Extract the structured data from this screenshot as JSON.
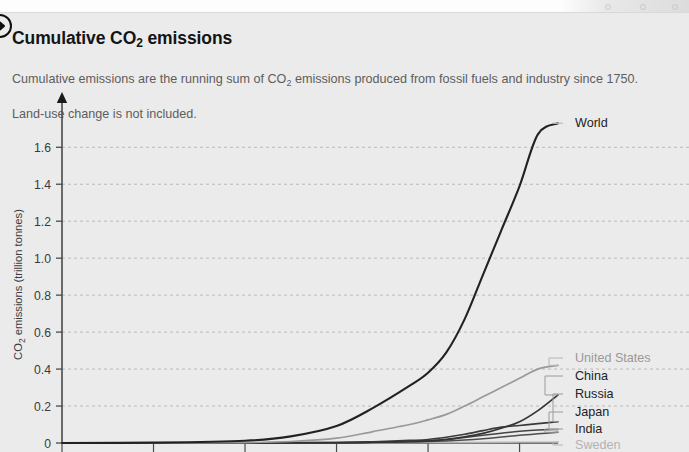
{
  "header": {
    "badge_icon": "circled-arrow-right-icon",
    "title_main": "Cumulative CO",
    "title_sub": "2",
    "title_tail": " emissions",
    "subtitle_part1": "Cumulative emissions are the running sum of CO",
    "subtitle_sub": "2",
    "subtitle_part2": " emissions produced from fossil fuels and industry since 1750.",
    "subtitle_line2": "Land-use change is not included."
  },
  "chart_data": {
    "type": "line",
    "title": "Cumulative CO2 emissions",
    "subtitle": "Cumulative emissions are the running sum of CO2 emissions produced from fossil fuels and industry since 1750. Land-use change is not included.",
    "xlabel": "",
    "ylabel": "CO2 emissions (trillion tonnes)",
    "ylabel_display": "CO",
    "ylabel_sub": "2",
    "ylabel_tail": " emissions (trillion tonnes)",
    "ylim": [
      0,
      1.78
    ],
    "xlim": [
      1750,
      2021
    ],
    "grid": true,
    "grid_style": "dashed-horizontal",
    "legend_position": "right-inline-labels",
    "yticks": [
      0,
      0.2,
      0.4,
      0.6,
      0.8,
      1.0,
      1.2,
      1.4,
      1.6
    ],
    "ytick_labels": [
      "0",
      "0.2",
      "0.4",
      "0.6",
      "0.8",
      "1.0",
      "1.2",
      "1.4",
      "1.6"
    ],
    "xticks": [
      1750,
      1800,
      1850,
      1900,
      1950,
      2000
    ],
    "xtick_labels": [],
    "series": [
      {
        "name": "World",
        "color": "#222222",
        "width": 2.1,
        "final_value": 1.73,
        "x": [
          1750,
          1800,
          1850,
          1875,
          1900,
          1920,
          1940,
          1950,
          1960,
          1970,
          1980,
          1990,
          2000,
          2010,
          2021
        ],
        "values": [
          0,
          0.002,
          0.012,
          0.036,
          0.092,
          0.19,
          0.31,
          0.38,
          0.49,
          0.67,
          0.91,
          1.15,
          1.39,
          1.67,
          1.73
        ]
      },
      {
        "name": "United States",
        "color": "#999999",
        "width": 1.7,
        "final_value": 0.42,
        "x": [
          1750,
          1800,
          1850,
          1875,
          1900,
          1920,
          1940,
          1950,
          1960,
          1970,
          1980,
          1990,
          2000,
          2010,
          2021
        ],
        "values": [
          0,
          0.0003,
          0.002,
          0.008,
          0.026,
          0.062,
          0.1,
          0.125,
          0.155,
          0.2,
          0.25,
          0.3,
          0.35,
          0.4,
          0.42
        ]
      },
      {
        "name": "China",
        "color": "#333333",
        "width": 1.7,
        "final_value": 0.26,
        "x": [
          1750,
          1850,
          1900,
          1920,
          1940,
          1950,
          1960,
          1970,
          1980,
          1990,
          2000,
          2010,
          2021
        ],
        "values": [
          0,
          0.0005,
          0.002,
          0.004,
          0.008,
          0.011,
          0.02,
          0.033,
          0.052,
          0.08,
          0.115,
          0.175,
          0.26
        ]
      },
      {
        "name": "Russia",
        "color": "#3a3a3a",
        "width": 1.6,
        "final_value": 0.115,
        "x": [
          1750,
          1850,
          1900,
          1920,
          1940,
          1950,
          1960,
          1970,
          1980,
          1990,
          2000,
          2010,
          2021
        ],
        "values": [
          0,
          0.0004,
          0.003,
          0.007,
          0.014,
          0.019,
          0.031,
          0.047,
          0.067,
          0.086,
          0.095,
          0.105,
          0.115
        ]
      },
      {
        "name": "Japan",
        "color": "#444444",
        "width": 1.5,
        "final_value": 0.073,
        "x": [
          1750,
          1850,
          1900,
          1920,
          1940,
          1950,
          1960,
          1970,
          1980,
          1990,
          2000,
          2010,
          2021
        ],
        "values": [
          0,
          0.0001,
          0.001,
          0.004,
          0.01,
          0.013,
          0.018,
          0.03,
          0.042,
          0.053,
          0.063,
          0.07,
          0.073
        ]
      },
      {
        "name": "India",
        "color": "#4d4d4d",
        "width": 1.5,
        "final_value": 0.058,
        "x": [
          1750,
          1850,
          1900,
          1920,
          1940,
          1950,
          1960,
          1970,
          1980,
          1990,
          2000,
          2010,
          2021
        ],
        "values": [
          0,
          0.0001,
          0.001,
          0.003,
          0.006,
          0.008,
          0.011,
          0.016,
          0.023,
          0.032,
          0.042,
          0.05,
          0.058
        ]
      },
      {
        "name": "Sweden",
        "color": "#b3b3b3",
        "width": 1.4,
        "final_value": 0.005,
        "x": [
          1750,
          1850,
          1900,
          1950,
          2000,
          2021
        ],
        "values": [
          0,
          0.0,
          0.0005,
          0.002,
          0.0045,
          0.005
        ]
      }
    ],
    "annotations": [
      {
        "label": "World",
        "color": "#222222",
        "value": 1.73
      },
      {
        "label": "United States",
        "color": "#999999",
        "value": 0.42
      },
      {
        "label": "China",
        "color": "#222222",
        "value": 0.26
      },
      {
        "label": "Russia",
        "color": "#222222",
        "value": 0.115
      },
      {
        "label": "Japan",
        "color": "#222222",
        "value": 0.073
      },
      {
        "label": "India",
        "color": "#222222",
        "value": 0.058
      },
      {
        "label": "Sweden",
        "color": "#b3b3b3",
        "value": 0.005
      }
    ]
  },
  "colors": {
    "background": "#ebebeb",
    "axis": "#4a4a4a",
    "grid": "#b9b9b9",
    "text_primary": "#141414",
    "text_secondary": "#5d5d5d",
    "muted": "#b3b3b3"
  }
}
